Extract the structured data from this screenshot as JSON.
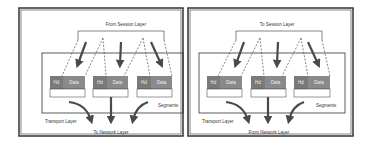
{
  "diagram": {
    "colors": {
      "border": "#333333",
      "header_fill": "#7a7a7a",
      "data_fill": "#8a8a8a",
      "arrow": "#4a4a4a",
      "background": "#ffffff"
    },
    "panels": [
      {
        "id": "sender",
        "top_label": "From Session Layer",
        "bottom_label": "To Network Layer",
        "transport_label": "Transport Layer",
        "segments_label": "Segments",
        "segments": [
          {
            "header": "Hd",
            "data": "Data"
          },
          {
            "header": "Hd",
            "data": "Data"
          },
          {
            "header": "Hd",
            "data": "Data"
          }
        ]
      },
      {
        "id": "receiver",
        "top_label": "To Session Layer",
        "bottom_label": "From Network Layer",
        "transport_label": "Transport Layer",
        "segments_label": "Segments",
        "segments": [
          {
            "header": "Hd",
            "data": "Data"
          },
          {
            "header": "Hd",
            "data": "Data"
          },
          {
            "header": "Hd",
            "data": "Data"
          }
        ]
      }
    ]
  }
}
